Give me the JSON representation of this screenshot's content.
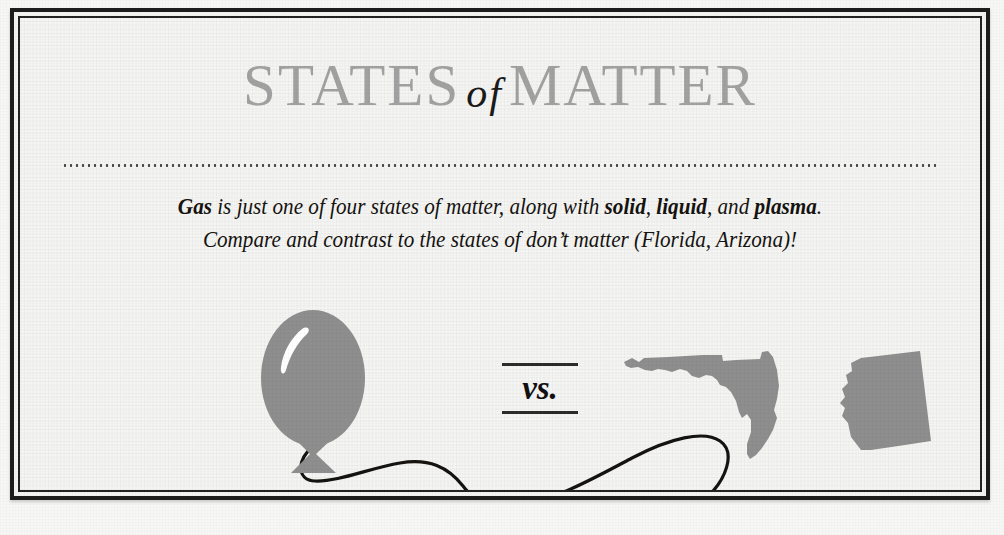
{
  "card": {
    "title": {
      "word1": "STATES",
      "conjunction": "of",
      "word2": "MATTER"
    },
    "body": {
      "line1_a": "Gas",
      "line1_b": " is just one of four states of matter, along with ",
      "line1_c": "solid",
      "line1_d": ", ",
      "line1_e": "liquid",
      "line1_f": ", and ",
      "line1_g": "plasma",
      "line1_h": ".",
      "line2": "Compare and contrast to the states of don’t matter (Florida, Arizona)!"
    },
    "comparison": {
      "vs_label": "vs.",
      "left_item": "balloon",
      "right_item_1": "florida-state-outline",
      "right_item_2": "arizona-state-outline"
    },
    "icons": {
      "balloon": "balloon-icon",
      "balloon_string": "balloon-string-icon",
      "florida": "florida-map-icon",
      "arizona": "arizona-map-icon"
    },
    "colors": {
      "paper": "#f4f4f2",
      "frame": "#1d1d1d",
      "title_gray": "#a1a1a1",
      "ink": "#15130f",
      "shape_gray": "#8e8e8e",
      "highlight": "#ffffff"
    }
  }
}
